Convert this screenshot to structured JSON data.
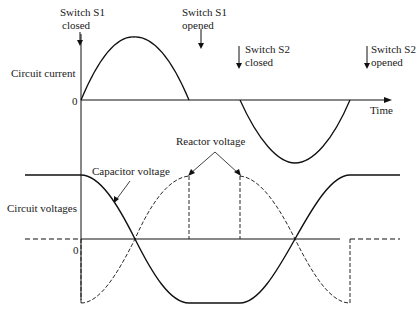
{
  "labels": {
    "s1_closed_1": "Switch S1",
    "s1_closed_2": "closed",
    "s1_opened_1": "Switch S1",
    "s1_opened_2": "opened",
    "s2_closed_1": "Switch S2",
    "s2_closed_2": "closed",
    "s2_opened_1": "Switch S2",
    "s2_opened_2": "opened",
    "circuit_current": "Circuit current",
    "circuit_voltages": "Circuit voltages",
    "zero_top": "0",
    "zero_bottom": "0",
    "time": "Time",
    "reactor_voltage": "Reactor voltage",
    "capacitor_voltage": "Capacitor voltage"
  },
  "colors": {
    "stroke": "#111111",
    "background": "#ffffff"
  }
}
